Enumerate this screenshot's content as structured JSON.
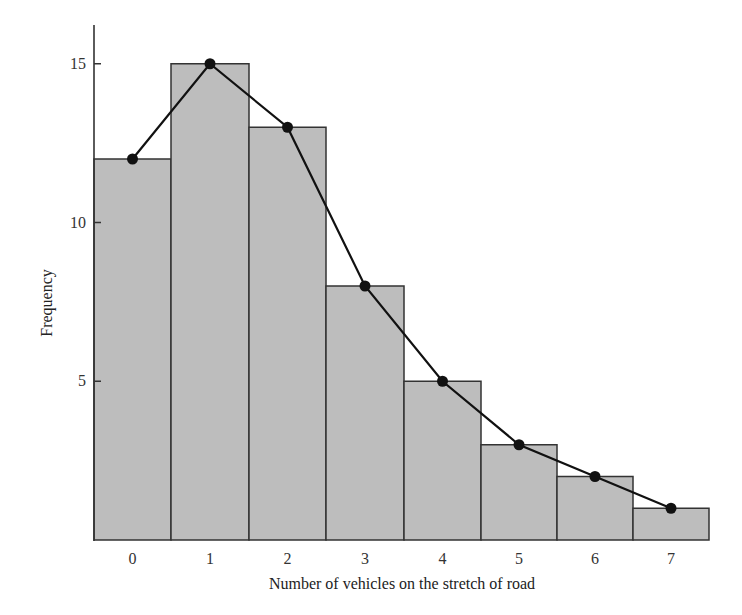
{
  "chart_data": {
    "type": "bar",
    "subtype": "histogram_with_frequency_polygon",
    "title": "",
    "xlabel": "Number of vehicles on the stretch of road",
    "ylabel": "Frequency",
    "categories": [
      "0",
      "1",
      "2",
      "3",
      "4",
      "5",
      "6",
      "7"
    ],
    "values": [
      12,
      15,
      13,
      8,
      5,
      3,
      2,
      1
    ],
    "series": [
      {
        "name": "Histogram",
        "type": "bar",
        "values": [
          12,
          15,
          13,
          8,
          5,
          3,
          2,
          1
        ]
      },
      {
        "name": "Frequency polygon",
        "type": "line",
        "values": [
          12,
          15,
          13,
          8,
          5,
          3,
          2,
          1
        ]
      }
    ],
    "yticks": [
      5,
      10,
      15
    ],
    "ylim": [
      0,
      16.2
    ],
    "grid": false,
    "legend": "none",
    "colors": {
      "bar_fill": "#bdbdbd",
      "bar_stroke": "#333333",
      "line": "#111111",
      "marker": "#111111",
      "axis": "#333333"
    }
  }
}
